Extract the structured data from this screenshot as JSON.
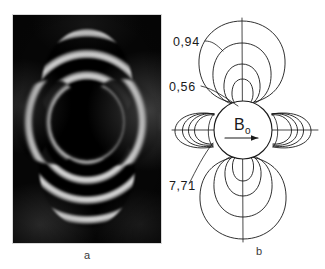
{
  "figure": {
    "panel_a": {
      "caption": "a",
      "kind": "photograph",
      "description": "dark four-lobed fringe pattern around an opaque sphere"
    },
    "panel_b": {
      "caption": "b",
      "kind": "contour-line-drawing",
      "field_label": "B",
      "field_subscript": "o",
      "contour_labels": [
        {
          "id": "contour-label-094",
          "text": "0,94"
        },
        {
          "id": "contour-label-056",
          "text": "0,56"
        },
        {
          "id": "contour-label-771",
          "text": "7,71"
        }
      ]
    }
  },
  "colors": {
    "ink": "#1a1a1a",
    "paper": "#ffffff",
    "plate": "#000000",
    "caption": "#3a3a3a"
  }
}
